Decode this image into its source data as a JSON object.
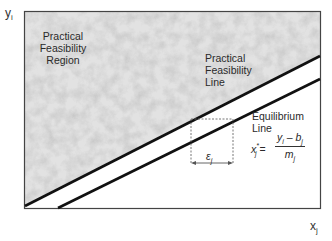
{
  "axes": {
    "y_label": "y",
    "y_sub": "i",
    "x_label": "x",
    "x_sub": "j"
  },
  "region": {
    "label_line1": "Practical",
    "label_line2": "Feasibility",
    "label_line3": "Region"
  },
  "feasibility_line": {
    "label_line1": "Practical",
    "label_line2": "Feasibility",
    "label_line3": "Line"
  },
  "equilibrium_line": {
    "label_line1": "Equilibrium",
    "label_line2": "Line"
  },
  "equation": {
    "lhs": "x",
    "lhs_sub": "j",
    "lhs_sup": "*",
    "equals": "=",
    "numerator": "y",
    "numerator_sub": "i",
    "numerator_minus": " – b",
    "numerator_sub2": "j",
    "denominator": "m",
    "denominator_sub": "j"
  },
  "epsilon": {
    "symbol": "ε",
    "sub": "j"
  },
  "colors": {
    "frame": "#444444",
    "lines": "#111111",
    "texture_base": "#d8d8d8",
    "dashed": "#666666"
  }
}
